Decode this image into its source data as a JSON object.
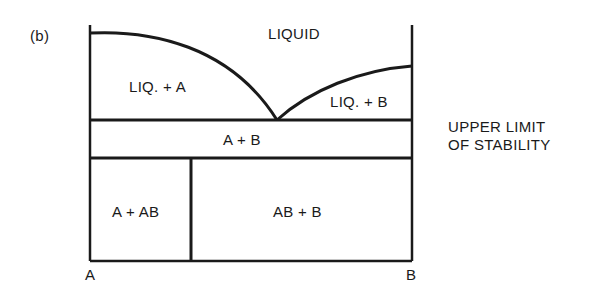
{
  "figure": {
    "panel_label": "(b)",
    "regions": {
      "liquid": "LIQUID",
      "liq_a": "LIQ. + A",
      "liq_b": "LIQ. + B",
      "a_b": "A + B",
      "a_ab": "A + AB",
      "ab_b": "AB + B"
    },
    "axis": {
      "left": "A",
      "right": "B"
    },
    "annotation": {
      "line1": "UPPER LIMIT",
      "line2": "OF STABILITY"
    },
    "colors": {
      "line": "#1a1a1a",
      "background": "#ffffff"
    }
  }
}
